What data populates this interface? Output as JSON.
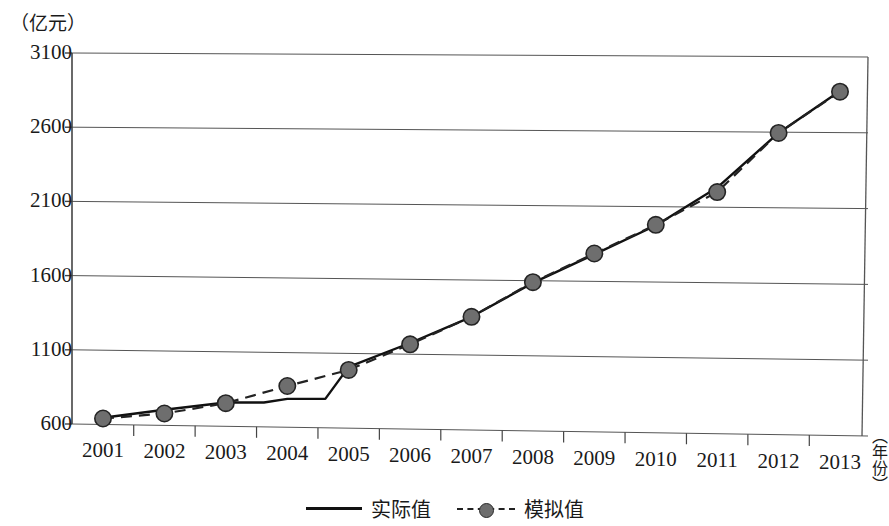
{
  "axes": {
    "y_unit_label": "（亿元）",
    "x_unit_label": "（年份）",
    "y_ticks": [
      "600",
      "1100",
      "1600",
      "2100",
      "2600",
      "3100"
    ],
    "x_ticks": [
      "2001",
      "2002",
      "2003",
      "2004",
      "2005",
      "2006",
      "2007",
      "2008",
      "2009",
      "2010",
      "2011",
      "2012",
      "2013"
    ]
  },
  "legend": {
    "items": [
      {
        "label": "实际值",
        "style": "solid-line",
        "color": "#111111"
      },
      {
        "label": "模拟值",
        "style": "dashed-line-with-circle-marker",
        "color": "#6e6e6e"
      }
    ]
  },
  "chart_data": {
    "type": "line",
    "title": "",
    "subtitle": "",
    "xlabel": "（年份）",
    "ylabel": "（亿元）",
    "x": [
      "2001",
      "2002",
      "2003",
      "2004",
      "2005",
      "2006",
      "2007",
      "2008",
      "2009",
      "2010",
      "2011",
      "2012",
      "2013"
    ],
    "ylim": [
      600,
      3100
    ],
    "ytick_step": 500,
    "grid": "horizontal-only",
    "legend_position": "bottom-center",
    "series": [
      {
        "name": "实际值",
        "style": "solid",
        "color": "#111111",
        "marker": "none",
        "values": [
          645,
          705,
          760,
          790,
          1010,
          1175,
          1355,
          1585,
          1780,
          1975,
          2230,
          2595,
          2875
        ]
      },
      {
        "name": "模拟值",
        "style": "dashed",
        "color": "#222222",
        "marker": "circle",
        "marker_fill": "#6e6e6e",
        "values": [
          640,
          680,
          755,
          876,
          990,
          1166,
          1355,
          1590,
          1785,
          1980,
          2200,
          2595,
          2870
        ]
      }
    ]
  }
}
